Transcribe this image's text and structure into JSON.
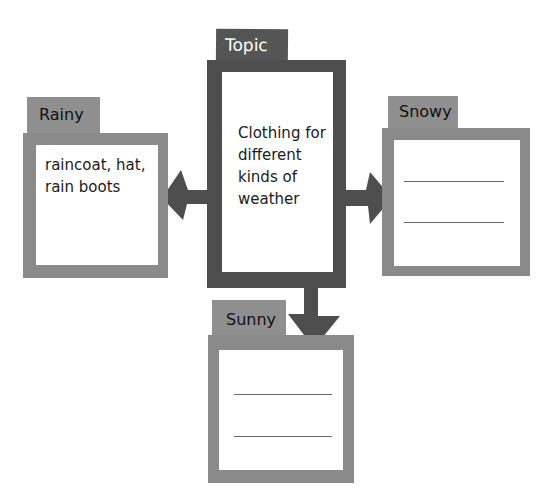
{
  "colors": {
    "topic_frame": "#4e4e4e",
    "topic_tab": "#555555",
    "category_frame": "#8a8a8a",
    "category_tab": "#8f8f8f",
    "arrow": "#4e4e4e",
    "background": "#ffffff"
  },
  "topic": {
    "tab_label": "Topic",
    "lines": [
      "Clothing for",
      "different",
      "kinds of",
      "weather"
    ]
  },
  "branches": [
    {
      "id": "rainy",
      "tab_label": "Rainy",
      "lines": [
        "raincoat, hat,",
        "rain boots"
      ],
      "blank_lines": 0,
      "arrow_direction": "left"
    },
    {
      "id": "snowy",
      "tab_label": "Snowy",
      "lines": [],
      "blank_lines": 2,
      "arrow_direction": "right"
    },
    {
      "id": "sunny",
      "tab_label": "Sunny",
      "lines": [],
      "blank_lines": 2,
      "arrow_direction": "down"
    }
  ]
}
